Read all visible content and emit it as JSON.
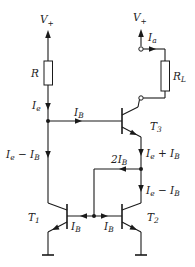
{
  "diagram": {
    "type": "circuit-schematic",
    "supply_left": {
      "main": "V",
      "sub": "+"
    },
    "supply_right": {
      "main": "V",
      "sub": "+"
    },
    "resistor_r": {
      "main": "R",
      "sub": ""
    },
    "resistor_load": {
      "main": "R",
      "sub": "L"
    },
    "current_ie": {
      "main": "I",
      "sub": "e"
    },
    "current_ia": {
      "main": "I",
      "sub": "a"
    },
    "current_ib_top": {
      "main": "I",
      "sub": "B"
    },
    "current_left_branch": {
      "main1": "I",
      "sub1": "e",
      "op": " − ",
      "main2": "I",
      "sub2": "B"
    },
    "current_t3_emitter": {
      "main1": "I",
      "sub1": "e",
      "op": " + ",
      "main2": "I",
      "sub2": "B"
    },
    "current_t2_collector": {
      "main1": "I",
      "sub1": "e",
      "op": " − ",
      "main2": "I",
      "sub2": "B"
    },
    "current_2ib": {
      "main": "2I",
      "sub": "B"
    },
    "current_ib_t1": {
      "main": "I",
      "sub": "B"
    },
    "current_ib_t2": {
      "main": "I",
      "sub": "B"
    },
    "transistor_t1": {
      "main": "T",
      "sub": "1"
    },
    "transistor_t2": {
      "main": "T",
      "sub": "2"
    },
    "transistor_t3": {
      "main": "T",
      "sub": "3"
    }
  }
}
